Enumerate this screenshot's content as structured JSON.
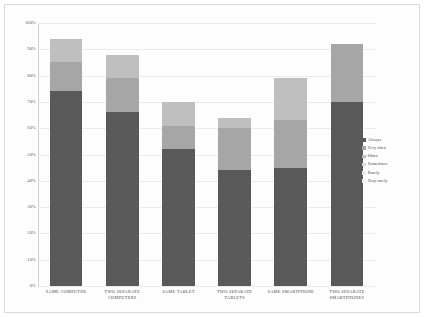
{
  "chart_data": {
    "type": "bar",
    "subtype": "stacked-percentage",
    "title": "",
    "xlabel": "",
    "ylabel": "",
    "ylim": [
      0,
      100
    ],
    "grid": true,
    "legend_position": "right",
    "categories": [
      "SAME COMPUTER",
      "TWO SEPARATE COMPUTERS",
      "SAME TABLET",
      "TWO SEPARATE TABLETS",
      "SAME SMARTPHONE",
      "TWO SEPARATE SMARTPHONES"
    ],
    "tick_labels": [
      "100%",
      "90%",
      "80%",
      "70%",
      "60%",
      "50%",
      "40%",
      "30%",
      "20%",
      "10%",
      "0%"
    ],
    "tick_values": [
      100,
      90,
      80,
      70,
      60,
      50,
      40,
      30,
      20,
      10,
      0
    ],
    "series": [
      {
        "name": "Always",
        "color": "#595959",
        "values": [
          74,
          66,
          52,
          44,
          45,
          70
        ]
      },
      {
        "name": "Very often",
        "color": "#a6a6a6",
        "values": [
          11,
          13,
          9,
          16,
          18,
          22
        ]
      },
      {
        "name": "Often",
        "color": "#bfbfbf",
        "values": [
          9,
          9,
          9,
          4,
          16,
          0
        ]
      },
      {
        "name": "Sometimes",
        "color": "#d9d9d9",
        "values": [
          0,
          0,
          0,
          0,
          0,
          0
        ]
      },
      {
        "name": "Rarely",
        "color": "#e8e8e8",
        "values": [
          0,
          0,
          0,
          0,
          0,
          0
        ]
      },
      {
        "name": "Very rarely",
        "color": "#f2f2f2",
        "values": [
          0,
          0,
          0,
          0,
          0,
          0
        ]
      }
    ],
    "totals": [
      94,
      88,
      70,
      64,
      79,
      92
    ],
    "annotations": []
  },
  "legend": {
    "items": [
      {
        "label": "Always"
      },
      {
        "label": "Very often"
      },
      {
        "label": "Often"
      },
      {
        "label": "Sometimes"
      },
      {
        "label": "Rarely"
      },
      {
        "label": "Very rarely"
      }
    ]
  },
  "colors": {
    "background": "#ffffff",
    "panel": "#fdfdfd",
    "border": "#d9d9d9",
    "grid": "#ebebeb",
    "axis": "#cfcfcf",
    "text": "#4a4a4a"
  }
}
